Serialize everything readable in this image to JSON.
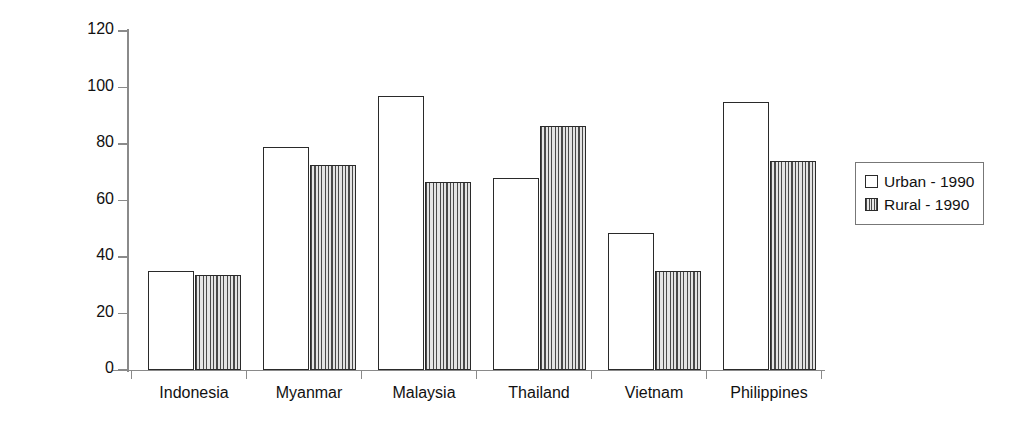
{
  "chart_data": {
    "type": "bar",
    "title": "",
    "xlabel": "",
    "ylabel": "Percentage of total population",
    "ylim": [
      0,
      120
    ],
    "yticks": [
      0,
      20,
      40,
      60,
      80,
      100,
      120
    ],
    "grid": false,
    "legend_position": "right",
    "categories": [
      "Indonesia",
      "Myanmar",
      "Malaysia",
      "Thailand",
      "Vietnam",
      "Philippines"
    ],
    "series": [
      {
        "name": "Urban - 1990",
        "swatch": "white-outlined",
        "values": [
          35,
          79,
          97,
          68,
          48.5,
          95
        ]
      },
      {
        "name": "Rural - 1990",
        "swatch": "vertical-hatch",
        "values": [
          33.5,
          72.5,
          66.5,
          86.5,
          35,
          74
        ]
      }
    ]
  },
  "legend": {
    "entries": [
      {
        "label": "Urban - 1990"
      },
      {
        "label": "Rural - 1990"
      }
    ]
  },
  "axis": {
    "y_title": "Percentage of total population",
    "y_tick_labels": [
      "120",
      "100",
      "80",
      "60",
      "40",
      "20",
      "0"
    ]
  }
}
